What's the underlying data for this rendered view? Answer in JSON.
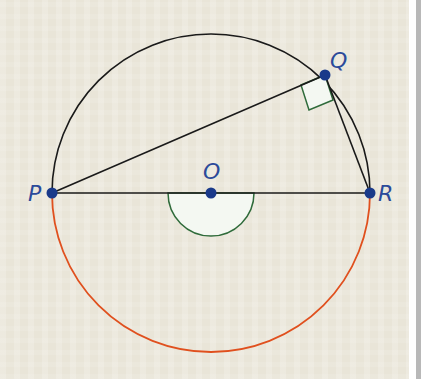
{
  "diagram": {
    "type": "circle-geometry",
    "points": {
      "P": {
        "label": "P",
        "x": 52,
        "y": 193
      },
      "Q": {
        "label": "Q",
        "x": 325,
        "y": 75
      },
      "R": {
        "label": "R",
        "x": 370,
        "y": 193
      },
      "O": {
        "label": "O",
        "x": 211,
        "y": 193
      }
    },
    "circle": {
      "center": "O",
      "radius": 159
    },
    "segments": [
      "PQ",
      "QR",
      "PR"
    ],
    "annotations": {
      "right_angle_at": "Q",
      "reflex_angle_at": "O",
      "highlighted_arc": "lower arc PR"
    },
    "colors": {
      "point": "#1a3a8a",
      "label": "#2b4a9a",
      "upper_arc": "#1a1a1a",
      "lower_arc": "#e0501e",
      "angle_marker_stroke": "#2f6b3a",
      "angle_marker_fill": "#f4f8f2",
      "background": "#e9e5d8"
    }
  }
}
